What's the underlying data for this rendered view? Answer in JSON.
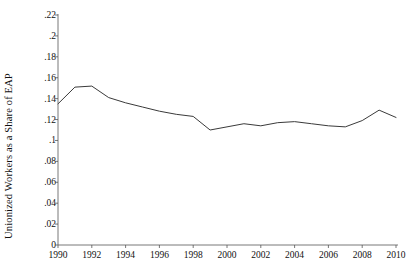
{
  "chart_data": {
    "type": "line",
    "title": "",
    "xlabel": "",
    "ylabel": "Unionized Workers as a Share of EAP",
    "xlim": [
      1990,
      2010
    ],
    "ylim": [
      0,
      0.22
    ],
    "grid": false,
    "legend": "none",
    "line_color": "#3a3a3a",
    "axis_color": "#555555",
    "background": "#ffffff",
    "x_ticks": [
      1990,
      1992,
      1994,
      1996,
      1998,
      2000,
      2002,
      2004,
      2006,
      2008,
      2010
    ],
    "x_tick_labels": [
      "1990",
      "1992",
      "1994",
      "1996",
      "1998",
      "2000",
      "2002",
      "2004",
      "2006",
      "2008",
      "2010"
    ],
    "y_ticks": [
      0,
      0.02,
      0.04,
      0.06,
      0.08,
      0.1,
      0.12,
      0.14,
      0.16,
      0.18,
      0.2,
      0.22
    ],
    "y_tick_labels": [
      "0",
      ".02",
      ".04",
      ".06",
      ".08",
      ".1",
      ".12",
      ".14",
      ".16",
      ".18",
      ".2",
      ".22"
    ],
    "series": [
      {
        "name": "Unionized Workers as a Share of EAP",
        "x": [
          1990,
          1991,
          1992,
          1993,
          1994,
          1995,
          1996,
          1997,
          1998,
          1999,
          2000,
          2001,
          2002,
          2003,
          2004,
          2005,
          2006,
          2007,
          2008,
          2009,
          2010
        ],
        "values": [
          0.135,
          0.151,
          0.152,
          0.141,
          0.136,
          0.132,
          0.128,
          0.125,
          0.123,
          0.11,
          0.113,
          0.116,
          0.114,
          0.117,
          0.118,
          0.116,
          0.114,
          0.113,
          0.119,
          0.129,
          0.122
        ]
      }
    ]
  }
}
